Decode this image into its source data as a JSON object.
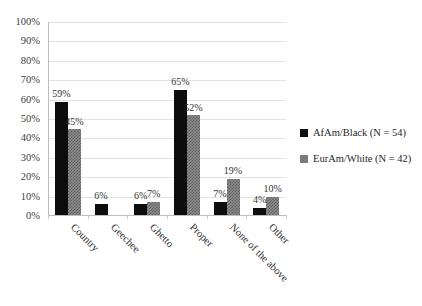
{
  "chart_data": {
    "type": "bar",
    "title": "",
    "xlabel": "",
    "ylabel": "",
    "ylim": [
      0,
      100
    ],
    "ytick_labels": [
      "0%",
      "10%",
      "20%",
      "30%",
      "40%",
      "50%",
      "60%",
      "70%",
      "80%",
      "90%",
      "100%"
    ],
    "ytick_values": [
      0,
      10,
      20,
      30,
      40,
      50,
      60,
      70,
      80,
      90,
      100
    ],
    "grid": true,
    "legend_position": "right",
    "categories": [
      "Country",
      "Geechee",
      "Ghetto",
      "Proper",
      "None of the above",
      "Other"
    ],
    "series": [
      {
        "name": "AfAm/Black (N = 54)",
        "color": "#0d0d0d",
        "values": [
          59,
          6,
          6,
          65,
          7,
          4
        ],
        "labels": [
          "59%",
          "6%",
          "6%",
          "65%",
          "7%",
          "4%"
        ]
      },
      {
        "name": "EurAm/White (N = 42)",
        "color": "#8c8c8c",
        "values": [
          45,
          0,
          7,
          52,
          19,
          10
        ],
        "labels": [
          "45%",
          "",
          "7%",
          "52%",
          "19%",
          "10%"
        ]
      }
    ]
  },
  "legend": {
    "items": [
      {
        "label": "AfAm/Black (N = 54)",
        "swatch": "series-a-swatch"
      },
      {
        "label": "EurAm/White (N = 42)",
        "swatch": "series-b-swatch"
      }
    ]
  }
}
